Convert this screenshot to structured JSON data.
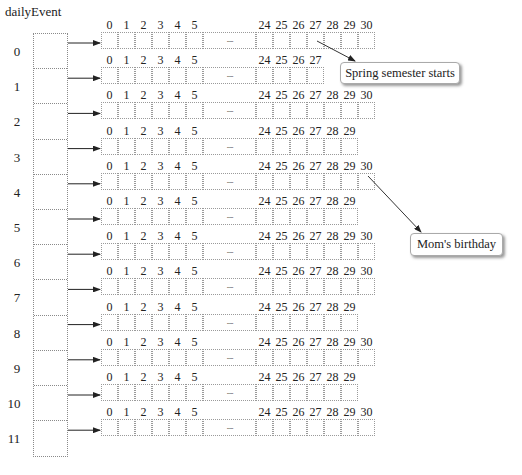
{
  "diagram": {
    "title": "dailyEvent",
    "row_labels": [
      "0",
      "1",
      "2",
      "3",
      "4",
      "5",
      "6",
      "7",
      "8",
      "9",
      "10",
      "11"
    ],
    "leading_indices": [
      "0",
      "1",
      "2",
      "3",
      "4",
      "5"
    ],
    "ellipsis": ".....",
    "rows": [
      {
        "index": "0",
        "last_index": 30,
        "tail": [
          "24",
          "25",
          "26",
          "27",
          "28",
          "29",
          "30"
        ]
      },
      {
        "index": "1",
        "last_index": 27,
        "tail": [
          "24",
          "25",
          "26",
          "27"
        ]
      },
      {
        "index": "2",
        "last_index": 30,
        "tail": [
          "24",
          "25",
          "26",
          "27",
          "28",
          "29",
          "30"
        ]
      },
      {
        "index": "3",
        "last_index": 29,
        "tail": [
          "24",
          "25",
          "26",
          "27",
          "28",
          "29"
        ]
      },
      {
        "index": "4",
        "last_index": 30,
        "tail": [
          "24",
          "25",
          "26",
          "27",
          "28",
          "29",
          "30"
        ]
      },
      {
        "index": "5",
        "last_index": 29,
        "tail": [
          "24",
          "25",
          "26",
          "27",
          "28",
          "29"
        ]
      },
      {
        "index": "6",
        "last_index": 30,
        "tail": [
          "24",
          "25",
          "26",
          "27",
          "28",
          "29",
          "30"
        ]
      },
      {
        "index": "7",
        "last_index": 30,
        "tail": [
          "24",
          "25",
          "26",
          "27",
          "28",
          "29",
          "30"
        ]
      },
      {
        "index": "8",
        "last_index": 29,
        "tail": [
          "24",
          "25",
          "26",
          "27",
          "28",
          "29"
        ]
      },
      {
        "index": "9",
        "last_index": 30,
        "tail": [
          "24",
          "25",
          "26",
          "27",
          "28",
          "29",
          "30"
        ]
      },
      {
        "index": "10",
        "last_index": 29,
        "tail": [
          "24",
          "25",
          "26",
          "27",
          "28",
          "29"
        ]
      },
      {
        "index": "11",
        "last_index": 30,
        "tail": [
          "24",
          "25",
          "26",
          "27",
          "28",
          "29",
          "30"
        ]
      }
    ],
    "callouts": [
      {
        "label": "Spring semester starts",
        "row": 0,
        "day": 27
      },
      {
        "label": "Mom's birthday",
        "row": 4,
        "day": 30
      }
    ],
    "colors": {
      "border": "#9a9a9a",
      "arrow": "#222222",
      "callout_shadow": "#999999"
    }
  }
}
